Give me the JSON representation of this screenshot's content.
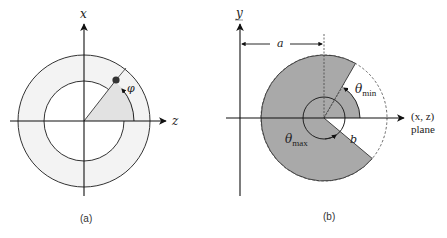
{
  "panel_a": {
    "caption": "(a)",
    "vertical_axis_label": "x",
    "horizontal_axis_label": "z",
    "angle_label": "φ",
    "colors": {
      "ring_fill": "#f2f2f2",
      "wedge_fill": "#e0e0e0",
      "point": "#333333",
      "stroke": "#222222"
    }
  },
  "panel_b": {
    "caption": "(b)",
    "vertical_axis_label": "y",
    "distance_label": "a",
    "radius_label": "b",
    "theta_min_symbol": "θ",
    "theta_min_sub": "min",
    "theta_max_symbol": "θ",
    "theta_max_sub": "max",
    "plane_label_line1": "(x, z)",
    "plane_label_line2": "plane",
    "colors": {
      "sector_fill": "#a9a9a9",
      "stroke": "#222222"
    }
  }
}
